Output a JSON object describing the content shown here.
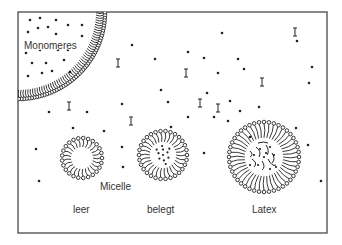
{
  "diagram": {
    "labels": {
      "monomer_droplet": "Monomeres",
      "micelle": "Micelle",
      "empty": "leer",
      "loaded": "belegt",
      "latex": "Latex"
    },
    "colors": {
      "stroke": "#222222",
      "frame": "#555555",
      "text": "#333333",
      "background": "#ffffff"
    },
    "frame": {
      "x": 18,
      "y": 12,
      "width": 309,
      "height": 221
    },
    "droplet": {
      "cx": 18,
      "cy": 12,
      "r": 87
    },
    "micelles": [
      {
        "name": "empty-micelle",
        "cx": 82,
        "cy": 158,
        "r": 20,
        "content": "empty"
      },
      {
        "name": "loaded-micelle",
        "cx": 163,
        "cy": 155,
        "r": 24,
        "content": "monomer"
      },
      {
        "name": "latex-particle",
        "cx": 264,
        "cy": 157,
        "r": 35,
        "content": "polymer"
      }
    ],
    "dots": [
      [
        30,
        20
      ],
      [
        40,
        18
      ],
      [
        56,
        20
      ],
      [
        68,
        25
      ],
      [
        82,
        25
      ],
      [
        28,
        32
      ],
      [
        38,
        28
      ],
      [
        48,
        27
      ],
      [
        56,
        34
      ],
      [
        82,
        36
      ],
      [
        26,
        53
      ],
      [
        40,
        50
      ],
      [
        58,
        50
      ],
      [
        68,
        50
      ],
      [
        32,
        63
      ],
      [
        46,
        63
      ],
      [
        64,
        60
      ],
      [
        28,
        76
      ],
      [
        42,
        73
      ],
      [
        52,
        71
      ],
      [
        70,
        72
      ],
      [
        132,
        45
      ],
      [
        222,
        33
      ],
      [
        297,
        41
      ],
      [
        188,
        52
      ],
      [
        155,
        59
      ],
      [
        238,
        59
      ],
      [
        204,
        58
      ],
      [
        161,
        90
      ],
      [
        218,
        73
      ],
      [
        244,
        69
      ],
      [
        207,
        93
      ],
      [
        230,
        101
      ],
      [
        122,
        104
      ],
      [
        168,
        102
      ],
      [
        214,
        117
      ],
      [
        240,
        111
      ],
      [
        171,
        127
      ],
      [
        87,
        112
      ],
      [
        49,
        112
      ],
      [
        73,
        128
      ],
      [
        104,
        131
      ],
      [
        188,
        117
      ],
      [
        296,
        128
      ],
      [
        250,
        137
      ],
      [
        36,
        149
      ],
      [
        122,
        147
      ],
      [
        39,
        181
      ],
      [
        123,
        167
      ],
      [
        204,
        153
      ],
      [
        228,
        121
      ],
      [
        312,
        67
      ],
      [
        308,
        145
      ],
      [
        321,
        181
      ],
      [
        259,
        107
      ],
      [
        309,
        83
      ]
    ],
    "initiators": [
      [
        118,
        63
      ],
      [
        186,
        73
      ],
      [
        295,
        32
      ],
      [
        218,
        108
      ],
      [
        69,
        106
      ],
      [
        131,
        121
      ],
      [
        262,
        82
      ],
      [
        200,
        103
      ]
    ]
  }
}
